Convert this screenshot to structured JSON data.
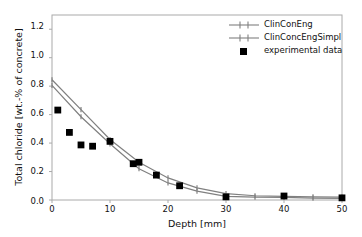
{
  "chart_data": {
    "type": "line",
    "title": "",
    "xlabel": "Depth [mm]",
    "ylabel": "Total chloride [wt.-% of concrete]",
    "xlim": [
      0,
      50
    ],
    "ylim": [
      0.0,
      1.3
    ],
    "grid": false,
    "legend_position": "upper right",
    "xticks": [
      "0",
      "10",
      "20",
      "30",
      "40",
      "50"
    ],
    "xtick_values": [
      0,
      10,
      20,
      30,
      40,
      50
    ],
    "yticks": [
      "0.0",
      "0.2",
      "0.4",
      "0.6",
      "0.8",
      "1.0",
      "1.2"
    ],
    "ytick_values": [
      0.0,
      0.2,
      0.4,
      0.6,
      0.8,
      1.0,
      1.2
    ],
    "series": [
      {
        "name": "ClinConEng",
        "style": "line-marker",
        "color": "#808080",
        "marker": "plus",
        "x": [
          0,
          5,
          10,
          15,
          20,
          25,
          30,
          35,
          40,
          45,
          50
        ],
        "values": [
          0.845,
          0.635,
          0.425,
          0.265,
          0.155,
          0.085,
          0.045,
          0.03,
          0.025,
          0.022,
          0.02
        ]
      },
      {
        "name": "ClinConcEngSimpl",
        "style": "line-marker",
        "color": "#808080",
        "marker": "plus",
        "x": [
          0,
          5,
          10,
          15,
          20,
          25,
          30,
          35,
          40,
          45,
          50
        ],
        "values": [
          0.805,
          0.585,
          0.395,
          0.22,
          0.12,
          0.062,
          0.025,
          0.02,
          0.018,
          0.013,
          0.012
        ]
      },
      {
        "name": "experimental data",
        "style": "scatter",
        "color": "#000000",
        "marker": "square",
        "x": [
          1,
          3,
          5,
          7,
          10,
          14,
          15,
          18,
          22,
          30,
          40,
          50
        ],
        "values": [
          0.632,
          0.475,
          0.387,
          0.378,
          0.412,
          0.255,
          0.265,
          0.175,
          0.1,
          0.022,
          0.028,
          0.015
        ]
      }
    ]
  },
  "legend": {
    "entries": [
      {
        "label": "ClinConEng",
        "marker": "line-plus-marker",
        "color": "#808080"
      },
      {
        "label": "ClinConcEngSimpl",
        "marker": "line-plus-marker",
        "color": "#808080"
      },
      {
        "label": "experimental data",
        "marker": "filled-square-marker",
        "color": "#000000"
      }
    ]
  },
  "axes": {
    "frame_color": "#aaaaaa",
    "text_color": "#111111"
  }
}
